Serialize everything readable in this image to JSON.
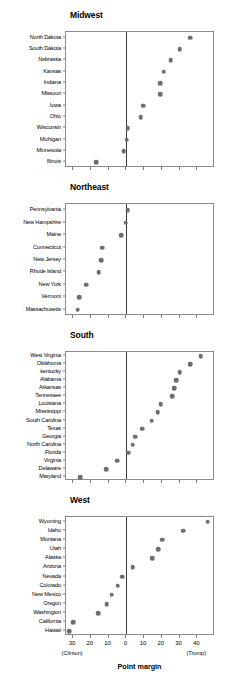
{
  "figure": {
    "axis_title": "Point margin",
    "left_end_label": "(Clinton)",
    "right_end_label": "(Trump)",
    "x_tick_labels": [
      "30",
      "20",
      "10",
      "0",
      "10",
      "20",
      "30",
      "40"
    ],
    "dot_color": "#6e6e6e",
    "zero_line_color": "#3a3a3a",
    "frame_color": "#8a8a8a"
  },
  "chart_data": {
    "type": "scatter",
    "title": "",
    "xlabel": "Point margin",
    "ylabel": "",
    "xlim": [
      -34,
      50
    ],
    "grid": false,
    "legend": "none",
    "x_ticks": [
      -30,
      -20,
      -10,
      0,
      10,
      20,
      30,
      40
    ],
    "x_tick_labels": [
      "30",
      "20",
      "10",
      "0",
      "10",
      "20",
      "30",
      "40"
    ],
    "annotations": [
      "(Clinton)",
      "(Trump)"
    ],
    "note": "Negative values favor Clinton, positive values favor Trump. Panels ordered top to bottom within each region by descending Trump margin.",
    "panels": [
      {
        "name": "Midwest",
        "categories": [
          "North Dakota",
          "South Dakota",
          "Nebraska",
          "Kansas",
          "Indiana",
          "Missouri",
          "Iowa",
          "Ohio",
          "Wisconsin",
          "Michigan",
          "Minnesota",
          "Illinois"
        ],
        "values": [
          36,
          30,
          25,
          21,
          19,
          19,
          9.5,
          8,
          0.8,
          0.3,
          -1.5,
          -17
        ]
      },
      {
        "name": "Northeast",
        "categories": [
          "Pennsylvania",
          "New Hampshire",
          "Maine",
          "Connecticut",
          "New Jersey",
          "Rhode Island",
          "New York",
          "Vermont",
          "Massachusetts"
        ],
        "values": [
          0.7,
          -0.4,
          -3,
          -13.6,
          -14,
          -15.5,
          -22.5,
          -26.5,
          -27.5
        ]
      },
      {
        "name": "South",
        "categories": [
          "West Virginia",
          "Oklahoma",
          "kentucky",
          "Alabama",
          "Arkansas",
          "Tennessee",
          "Louisiana",
          "Mississippi",
          "South Carolina",
          "Texas",
          "Georgia",
          "North Carolina",
          "Florida",
          "Virginia",
          "Delaware",
          "Maryland"
        ],
        "values": [
          42,
          36,
          30,
          28,
          27,
          26,
          19.5,
          17.8,
          14.3,
          9,
          5.1,
          3.6,
          1.2,
          -5.3,
          -11.4,
          -26
        ]
      },
      {
        "name": "West",
        "categories": [
          "Wyoming",
          "Idaho",
          "Montana",
          "Utah",
          "Alaska",
          "Arizona",
          "Nevada",
          "Colorado",
          "New Mexico",
          "Oregon",
          "Washington",
          "California",
          "Hawaii"
        ],
        "values": [
          46,
          32,
          20.4,
          18,
          14.7,
          3.5,
          -2.4,
          -4.9,
          -8.2,
          -11,
          -15.7,
          -30,
          -32.2
        ]
      }
    ]
  }
}
